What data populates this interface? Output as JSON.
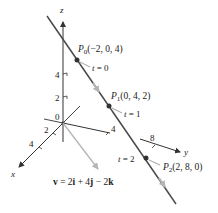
{
  "diagram": {
    "axes": {
      "z": {
        "label": "z",
        "ticks": [
          "4",
          "2"
        ]
      },
      "x": {
        "label": "x",
        "ticks": [
          "2",
          "4"
        ]
      },
      "y": {
        "label": "y",
        "ticks": [
          "4",
          "8"
        ]
      },
      "origin_label": "0"
    },
    "points": [
      {
        "name": "P",
        "sub": "0",
        "coords": "(−2, 0, 4)",
        "t_label": "t = 0"
      },
      {
        "name": "P",
        "sub": "1",
        "coords": "(0, 4, 2)",
        "t_label": "t = 1"
      },
      {
        "name": "P",
        "sub": "2",
        "coords": "(2, 8, 0)",
        "t_label": "t = 2"
      }
    ],
    "vector": {
      "v": "v",
      "eq": " = 2",
      "i": "i",
      "plus": " + 4",
      "j": "j",
      "minus": " − 2",
      "k": "k"
    },
    "colors": {
      "line": "#4a4a4a",
      "axis": "#333333",
      "vector": "#b5b5b5",
      "point": "#333333"
    }
  }
}
